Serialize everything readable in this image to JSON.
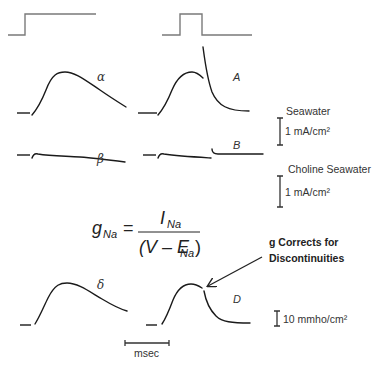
{
  "panels": {
    "alpha": {
      "label": "α"
    },
    "A": {
      "label": "A"
    },
    "beta": {
      "label": "β"
    },
    "B": {
      "label": "B"
    },
    "delta": {
      "label": "δ"
    },
    "D": {
      "label": "D"
    }
  },
  "conditions": {
    "seawater": "Seawater",
    "choline_seawater": "Choline Seawater"
  },
  "scales": {
    "current_seawater": "1 mA/cm²",
    "current_choline": "1 mA/cm²",
    "conductance": "10 mmho/cm²",
    "time": "msec"
  },
  "equation": {
    "lhs_var": "g",
    "lhs_sub": "Na",
    "equals": "=",
    "num_var": "I",
    "num_sub": "Na",
    "den_open": "(V – E",
    "den_sub": "Na",
    "den_close": ")"
  },
  "annotation": {
    "line1": "g Corrects for",
    "line2": "Discontinuities"
  },
  "colors": {
    "step_protocol": "#7a7a7a",
    "trace": "#1a1a1a",
    "text": "#333333"
  }
}
